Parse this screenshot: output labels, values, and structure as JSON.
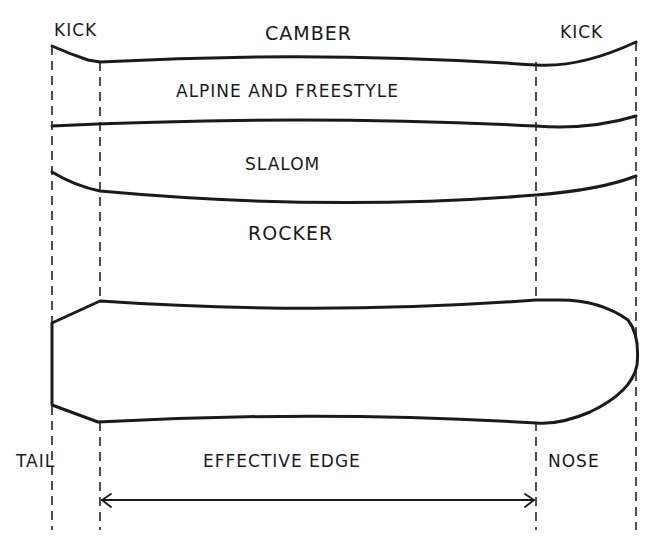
{
  "diagram": {
    "labels": {
      "kick_left": "KICK",
      "camber": "CAMBER",
      "kick_right": "KICK",
      "alpine_freestyle": "ALPINE AND FREESTYLE",
      "slalom": "SLALOM",
      "rocker": "ROCKER",
      "tail": "TAIL",
      "effective_edge": "EFFECTIVE EDGE",
      "nose": "NOSE"
    },
    "profiles": [
      {
        "name": "camber",
        "description": "Camber profile with kicks at tail and nose"
      },
      {
        "name": "alpine-and-freestyle",
        "description": "Flat profile with kick at nose"
      },
      {
        "name": "slalom / rocker",
        "description": "Rocker curve rising at both ends"
      }
    ],
    "guides": {
      "tail_x": 52,
      "edge_start_x": 100,
      "edge_end_x": 536,
      "nose_x": 636
    },
    "colors": {
      "ink": "#1a1a1a",
      "background": "#ffffff"
    }
  }
}
